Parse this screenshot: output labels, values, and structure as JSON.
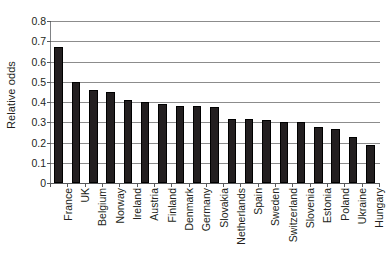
{
  "chart_data": {
    "type": "bar",
    "title": "",
    "subtitle": "",
    "xlabel": "",
    "ylabel": "Relative odds",
    "ylim": [
      0,
      0.8
    ],
    "ytick_labels": [
      "0.8",
      "0.7",
      "0.6",
      "0.5",
      "0.4",
      "0.3",
      "0.2",
      "0.1",
      "0"
    ],
    "ytick_values": [
      0.8,
      0.7,
      0.6,
      0.5,
      0.4,
      0.3,
      0.2,
      0.1,
      0
    ],
    "grid": true,
    "grid_axis": "y",
    "legend": false,
    "legend_position": "none",
    "bar_color": "#231f20",
    "grid_color": "#8c8c8c",
    "axis_color": "#58595b",
    "categories": [
      "France",
      "UK",
      "Belgium",
      "Norway",
      "Ireland",
      "Austria",
      "Finland",
      "Denmark",
      "Germany",
      "Slovakia",
      "Netherlands",
      "Spain",
      "Sweden",
      "Switzerland",
      "Slovenia",
      "Estonia",
      "Poland",
      "Ukraine",
      "Hungary"
    ],
    "values": [
      0.67,
      0.5,
      0.46,
      0.45,
      0.41,
      0.4,
      0.39,
      0.38,
      0.38,
      0.375,
      0.315,
      0.315,
      0.31,
      0.3,
      0.3,
      0.275,
      0.265,
      0.225,
      0.19
    ]
  }
}
